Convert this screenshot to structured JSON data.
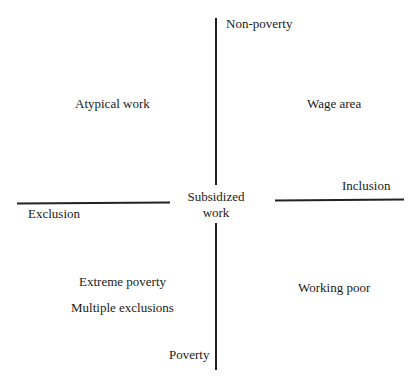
{
  "diagram": {
    "axes": {
      "vertical_top": "Non-poverty",
      "vertical_bottom": "Poverty",
      "horizontal_left": "Exclusion",
      "horizontal_right": "Inclusion"
    },
    "center": {
      "line1": "Subsidized",
      "line2": "work"
    },
    "quadrants": {
      "top_left": "Atypical work",
      "top_right": "Wage area",
      "bottom_left_1": "Extreme poverty",
      "bottom_left_2": "Multiple exclusions",
      "bottom_right": "Working poor"
    }
  }
}
